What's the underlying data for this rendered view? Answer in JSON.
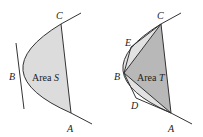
{
  "figures": [
    {
      "id": "left",
      "labels": {
        "A": "A",
        "B": "B",
        "C": "C"
      },
      "area_prefix": "Area ",
      "area_symbol": "S",
      "fill": "#dcdcdc"
    },
    {
      "id": "right",
      "labels": {
        "A": "A",
        "B": "B",
        "C": "C",
        "D": "D",
        "E": "E"
      },
      "area_prefix": "Area ",
      "area_symbol": "T",
      "fill_triangle": "#b8b8b8",
      "fill_small": "#e2e2e2"
    }
  ],
  "colors": {
    "stroke": "#333333",
    "text": "#222222"
  }
}
